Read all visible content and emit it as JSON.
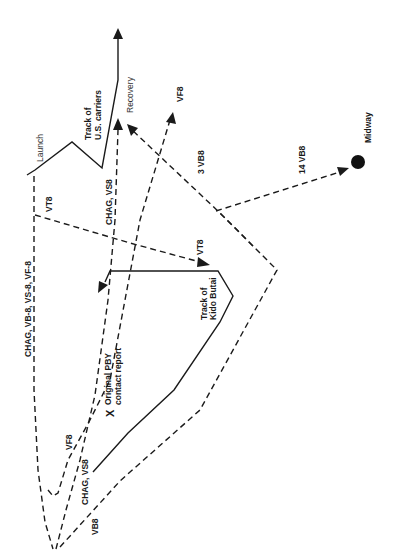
{
  "diagram": {
    "orientation": "rotated-90-ccw",
    "labels": {
      "launch": "Launch",
      "us_track": [
        "Track of",
        "U.S. carriers"
      ],
      "recovery": "Recovery",
      "vf8_top": "VF8",
      "midway": "Midway",
      "vb8_14": "14 VB8",
      "vb8_3": "3 VB8",
      "chag_vs8_top": "CHAG, VS8",
      "vt8_left": "VT8",
      "vt8_right": "VT8",
      "chag_group": "CHAG, VB-8, VS-8, VF-8",
      "kido_track": [
        "Track of",
        "Kido Butai"
      ],
      "pby": [
        "Original PBY",
        "contact report"
      ],
      "pby_mark": "X",
      "vf8_bottom": "VF8",
      "chag_vs8_bottom": "CHAG, VS8",
      "vb8_bottom": "VB8"
    },
    "routes": [
      {
        "name": "track-us-carriers",
        "style": "solid",
        "desc": "Track of U.S. carriers"
      },
      {
        "name": "track-kido-butai",
        "style": "solid",
        "desc": "Track of Kido Butai"
      },
      {
        "name": "route-chag-group",
        "style": "dashed",
        "desc": "CHAG, VB-8, VS-8, VF-8 outbound"
      },
      {
        "name": "route-vt8",
        "style": "dashed",
        "desc": "VT8 to Kido Butai"
      },
      {
        "name": "route-vf8",
        "style": "dashed",
        "desc": "VF8 return"
      },
      {
        "name": "route-chag-vs8",
        "style": "dashed",
        "desc": "CHAG, VS8 return to recovery"
      },
      {
        "name": "route-vb8",
        "style": "dashed",
        "desc": "VB8 southern leg"
      },
      {
        "name": "route-3-vb8",
        "style": "dashed",
        "desc": "3 VB8 to recovery"
      },
      {
        "name": "route-14-vb8",
        "style": "dashed",
        "desc": "14 VB8 to Midway"
      }
    ],
    "points": [
      {
        "name": "midway",
        "label": "Midway"
      },
      {
        "name": "pby-contact",
        "label": "Original PBY contact report"
      }
    ]
  }
}
